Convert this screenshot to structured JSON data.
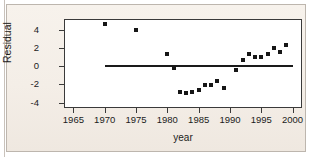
{
  "chart_data": {
    "type": "scatter",
    "title": "",
    "xlabel": "year",
    "ylabel": "Residual",
    "xlim": [
      1963.5,
      2001.5
    ],
    "ylim": [
      -4.6,
      5.2
    ],
    "grid": false,
    "legend": null,
    "xticks": [
      1965,
      1970,
      1975,
      1980,
      1985,
      1990,
      1995,
      2000
    ],
    "xtick_labels": [
      "1965",
      "1970",
      "1975",
      "1980",
      "1985",
      "1990",
      "1995",
      "2000"
    ],
    "yticks": [
      4,
      2,
      0,
      -2,
      -4
    ],
    "ytick_labels": [
      "4",
      "2",
      "0",
      "-2",
      "-4"
    ],
    "reference_line": {
      "type": "horizontal",
      "y": 0,
      "x_start": 1970,
      "x_end": 2000,
      "color": "#1a1a1a"
    },
    "marker": {
      "shape": "square",
      "color": "#161616",
      "size": 4
    },
    "x": [
      1970,
      1975,
      1980,
      1981,
      1982,
      1983,
      1984,
      1985,
      1986,
      1987,
      1988,
      1989,
      1991,
      1992,
      1993,
      1994,
      1995,
      1996,
      1997,
      1998,
      1999
    ],
    "y": [
      4.6,
      4.0,
      1.4,
      -0.2,
      -2.8,
      -2.9,
      -2.8,
      -2.6,
      -2.1,
      -2.1,
      -1.6,
      -2.4,
      -0.4,
      0.7,
      1.3,
      1.0,
      1.0,
      1.4,
      2.0,
      1.6,
      2.3
    ],
    "points": [
      {
        "x": 1970,
        "y": 4.6
      },
      {
        "x": 1975,
        "y": 4.0
      },
      {
        "x": 1980,
        "y": 1.4
      },
      {
        "x": 1981,
        "y": -0.2
      },
      {
        "x": 1982,
        "y": -2.8
      },
      {
        "x": 1983,
        "y": -2.9
      },
      {
        "x": 1984,
        "y": -2.8
      },
      {
        "x": 1985,
        "y": -2.6
      },
      {
        "x": 1986,
        "y": -2.1
      },
      {
        "x": 1987,
        "y": -2.1
      },
      {
        "x": 1988,
        "y": -1.6
      },
      {
        "x": 1989,
        "y": -2.4
      },
      {
        "x": 1991,
        "y": -0.4
      },
      {
        "x": 1992,
        "y": 0.7
      },
      {
        "x": 1993,
        "y": 1.3
      },
      {
        "x": 1994,
        "y": 1.0
      },
      {
        "x": 1995,
        "y": 1.0
      },
      {
        "x": 1996,
        "y": 1.4
      },
      {
        "x": 1997,
        "y": 2.0
      },
      {
        "x": 1998,
        "y": 1.6
      },
      {
        "x": 1999,
        "y": 2.3
      }
    ]
  },
  "colors": {
    "page_background": "#f6f0ea",
    "plot_background": "#ffffff",
    "axis": "#3a3a3a",
    "marker": "#161616",
    "reference_line": "#1a1a1a",
    "border": "#bdb6ae"
  }
}
